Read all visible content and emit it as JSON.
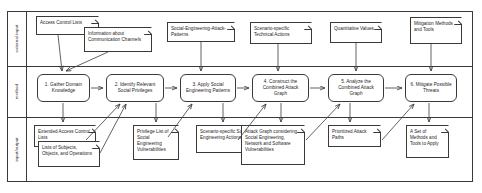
{
  "diagram": {
    "lanes": [
      {
        "id": "external-input",
        "label": "external input"
      },
      {
        "id": "method",
        "label": "method"
      },
      {
        "id": "input-output",
        "label": "input/output"
      }
    ],
    "external_inputs": [
      {
        "id": "access-control-lists",
        "text": "Access Control Lists"
      },
      {
        "id": "information-about-communication-channels",
        "text": "Information about Communication Channels"
      },
      {
        "id": "social-engineering-attack-patterns",
        "text": "Social-Engineering-Attack-Patterns"
      },
      {
        "id": "scenario-specific-technical-actions",
        "text": "Scenario-specific Technical Actions"
      },
      {
        "id": "quantitative-values",
        "text": "Quantitative Values"
      },
      {
        "id": "mitigation-methods-and-tools",
        "text": "Mitigation Methods and Tools"
      }
    ],
    "activities": [
      {
        "id": "step-1",
        "number": "1.",
        "text": "1. Gather Domain Knowledge"
      },
      {
        "id": "step-2",
        "number": "2.",
        "text": "2. Identify Relevant Social Privileges"
      },
      {
        "id": "step-3",
        "number": "3.",
        "text": "3. Apply Social Engineering Patterns"
      },
      {
        "id": "step-4",
        "number": "4.",
        "text": "4. Construct the Combined Attack Graph"
      },
      {
        "id": "step-5",
        "number": "5.",
        "text": "5. Analyze the Combined Attack Graph"
      },
      {
        "id": "step-6",
        "number": "6.",
        "text": "6. Mitigate Possible Threats"
      }
    ],
    "outputs": [
      {
        "id": "extended-access-control-lists",
        "text": "Extended Access Control Lists"
      },
      {
        "id": "lists-of-subjects-objects-and-operations",
        "text": "Lists of Subjects, Objects, and Operations"
      },
      {
        "id": "privilege-list-of-social-engineering-vulnerabilities",
        "text": "Privilege List of Social Engineering Vulnerabilities"
      },
      {
        "id": "scenario-specific-social-engineering-actions",
        "text": "Scenario-specific Social Engineering Actions"
      },
      {
        "id": "attack-graph-combined",
        "text": "Attack Graph considering Social Engineering, Network and Software Vulnerabilities"
      },
      {
        "id": "prioritized-attack-paths",
        "text": "Prioritized Attack Paths"
      },
      {
        "id": "a-set-of-methods-and-tools-to-apply",
        "text": "A Set of Methods and Tools to Apply"
      }
    ],
    "colors": {
      "stroke": "#3a3a3a",
      "background": "#ffffff",
      "text": "#1d1d1d"
    }
  }
}
